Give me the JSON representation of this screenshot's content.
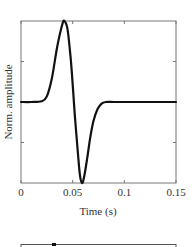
{
  "chart_data": {
    "type": "line",
    "title": "",
    "xlabel": "Time (s)",
    "ylabel": "Norm. amplitude",
    "xlim": [
      0,
      0.15
    ],
    "ylim": [
      -1,
      1
    ],
    "x_ticks": [
      0,
      0.05,
      0.1,
      0.15
    ],
    "x_tick_labels": [
      "0",
      "0.05",
      "0.1",
      "0.15"
    ],
    "y_ticks": [
      -0.5,
      0,
      0.5
    ],
    "y_tick_labels": [],
    "grid": false,
    "legend": null,
    "series": [
      {
        "name": "waveform",
        "color": "#111111",
        "x": [
          0,
          0.01,
          0.02,
          0.025,
          0.03,
          0.035,
          0.04,
          0.042,
          0.045,
          0.048,
          0.05,
          0.052,
          0.055,
          0.057,
          0.059,
          0.061,
          0.064,
          0.067,
          0.07,
          0.074,
          0.078,
          0.082,
          0.09,
          0.1,
          0.12,
          0.15
        ],
        "y": [
          0,
          0,
          0.01,
          0.07,
          0.3,
          0.68,
          0.96,
          1.0,
          0.9,
          0.55,
          0.22,
          -0.15,
          -0.62,
          -0.9,
          -1.0,
          -0.93,
          -0.7,
          -0.44,
          -0.24,
          -0.09,
          -0.02,
          0,
          0,
          0,
          0,
          0
        ]
      }
    ],
    "partial_next_panel": {
      "visible": "top border of a subsequent axes frame at the bottom edge"
    }
  }
}
